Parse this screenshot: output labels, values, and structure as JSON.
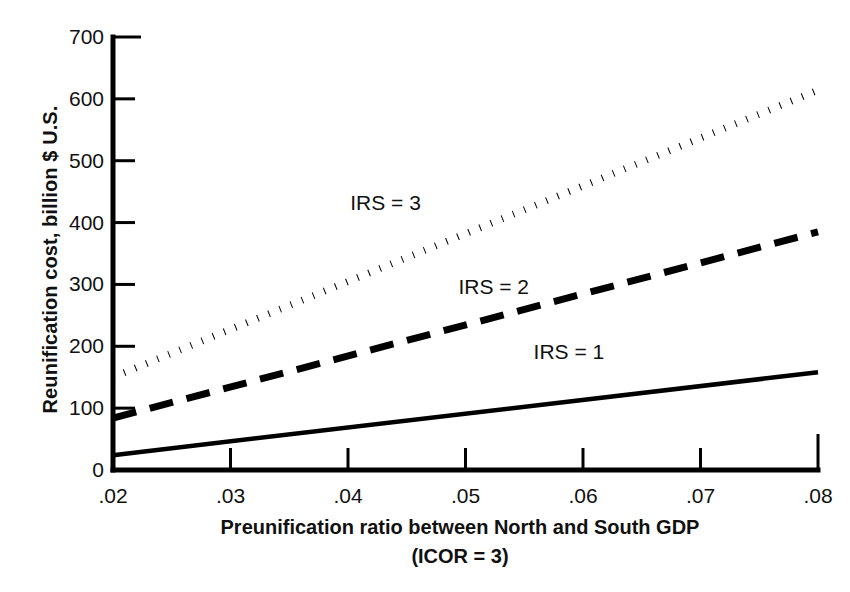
{
  "chart_data": {
    "type": "line",
    "title": "",
    "xlabel": "Preunification ratio between North and South GDP",
    "xlabel_line2": "(ICOR = 3)",
    "ylabel": "Reunification cost, billion $ U.S.",
    "xlim": [
      0.02,
      0.08
    ],
    "ylim": [
      0,
      700
    ],
    "xticks": [
      0.02,
      0.03,
      0.04,
      0.05,
      0.06,
      0.07,
      0.08
    ],
    "xtick_labels": [
      ".02",
      ".03",
      ".04",
      ".05",
      ".06",
      ".07",
      ".08"
    ],
    "yticks": [
      0,
      100,
      200,
      300,
      400,
      500,
      600,
      700
    ],
    "ytick_labels": [
      "0",
      "100",
      "200",
      "300",
      "400",
      "500",
      "600",
      "700"
    ],
    "grid": false,
    "legend_position": "inline-annotations",
    "x": [
      0.02,
      0.08
    ],
    "series": [
      {
        "name": "IRS = 3",
        "style": "dotted",
        "color": "#000000",
        "values": [
          150,
          614
        ],
        "annotation": "IRS = 3",
        "annotation_x": 0.0432,
        "annotation_y": 432
      },
      {
        "name": "IRS = 2",
        "style": "dashed",
        "color": "#000000",
        "values": [
          84,
          385
        ],
        "annotation": "IRS = 2",
        "annotation_x": 0.0524,
        "annotation_y": 296
      },
      {
        "name": "IRS = 1",
        "style": "solid",
        "color": "#000000",
        "values": [
          24,
          158
        ],
        "annotation": "IRS = 1",
        "annotation_x": 0.0588,
        "annotation_y": 190
      }
    ]
  },
  "axis": {
    "frame_color": "#000000"
  }
}
